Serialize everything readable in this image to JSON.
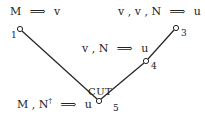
{
  "diagram": {
    "type": "proof-tree",
    "nodes": [
      {
        "id": "1",
        "label": "1",
        "sequent": {
          "left": "M",
          "arrow": "⟹",
          "right": "v"
        }
      },
      {
        "id": "3",
        "label": "3",
        "sequent": {
          "left": "v , v , N",
          "arrow": "⟹",
          "right": "u"
        }
      },
      {
        "id": "4",
        "label": "4",
        "sequent": {
          "left": "v , N",
          "arrow": "⟹",
          "right": "u"
        }
      },
      {
        "id": "5",
        "label": "5",
        "sequent": {
          "left_base": "M , N",
          "left_sup": "†",
          "arrow": "⟹",
          "right": "u"
        }
      }
    ],
    "edges": [
      {
        "from": "1",
        "to": "5"
      },
      {
        "from": "4",
        "to": "5"
      },
      {
        "from": "3",
        "to": "4"
      }
    ],
    "rule_label": "CUT",
    "colors": {
      "line": "#222222",
      "background": "#ffffff"
    }
  }
}
